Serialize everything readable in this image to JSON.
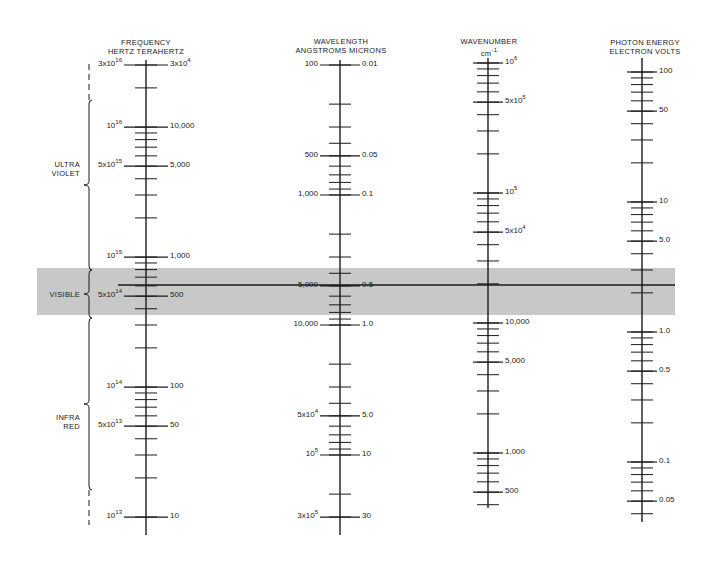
{
  "chart_data": {
    "type": "nomogram",
    "scale": "log10, 130 px per decade, all axes aligned",
    "visible_band": {
      "label": "VISIBLE",
      "highlight_color": "#c8c8c8",
      "reference_line_frequency_hz": 600000000000000.0
    },
    "regions": [
      {
        "label": "ULTRA VIOLET",
        "from_hz": 3e+16,
        "to_hz": 750000000000000.0
      },
      {
        "label": "VISIBLE",
        "from_hz": 750000000000000.0,
        "to_hz": 400000000000000.0
      },
      {
        "label": "INFRA RED",
        "from_hz": 400000000000000.0,
        "to_hz": 10000000000000.0
      }
    ],
    "axes": [
      {
        "name": "FREQUENCY",
        "units": [
          "HERTZ",
          "TERAHERTZ"
        ],
        "major": [
          {
            "hz": 3e+16,
            "left": "3x10^16",
            "right": "3x10^4"
          },
          {
            "hz": 1e+16,
            "left": "10^16",
            "right": "10,000"
          },
          {
            "hz": 5000000000000000.0,
            "left": "5x10^15",
            "right": "5,000"
          },
          {
            "hz": 1000000000000000.0,
            "left": "10^15",
            "right": "1,000"
          },
          {
            "hz": 500000000000000.0,
            "left": "5x10^14",
            "right": "500"
          },
          {
            "hz": 100000000000000.0,
            "left": "10^14",
            "right": "100"
          },
          {
            "hz": 50000000000000.0,
            "left": "5x10^13",
            "right": "50"
          },
          {
            "hz": 10000000000000.0,
            "left": "10^13",
            "right": "10"
          }
        ]
      },
      {
        "name": "WAVELENGTH",
        "units": [
          "ANGSTROMS",
          "MICRONS"
        ],
        "major": [
          {
            "angstrom": 100,
            "left": "100",
            "right": "0.01"
          },
          {
            "angstrom": 500,
            "left": "500",
            "right": "0.05"
          },
          {
            "angstrom": 1000,
            "left": "1,000",
            "right": "0.1"
          },
          {
            "angstrom": 5000,
            "left": "5,000",
            "right": "0.5"
          },
          {
            "angstrom": 10000,
            "left": "10,000",
            "right": "1.0"
          },
          {
            "angstrom": 50000,
            "left": "5x10^4",
            "right": "5.0"
          },
          {
            "angstrom": 100000,
            "left": "10^5",
            "right": "10"
          },
          {
            "angstrom": 300000,
            "left": "3x10^5",
            "right": "30"
          }
        ]
      },
      {
        "name": "WAVENUMBER",
        "units": [
          "cm^-1"
        ],
        "major": [
          {
            "value": 1000000.0,
            "label": "10^6"
          },
          {
            "value": 500000.0,
            "label": "5x10^5"
          },
          {
            "value": 100000.0,
            "label": "10^5"
          },
          {
            "value": 50000.0,
            "label": "5x10^4"
          },
          {
            "value": 10000.0,
            "label": "10,000"
          },
          {
            "value": 5000.0,
            "label": "5,000"
          },
          {
            "value": 1000.0,
            "label": "1,000"
          },
          {
            "value": 500,
            "label": "500"
          }
        ]
      },
      {
        "name": "PHOTON ENERGY",
        "units": [
          "ELECTRON VOLTS"
        ],
        "major": [
          {
            "value": 100,
            "label": "100"
          },
          {
            "value": 50,
            "label": "50"
          },
          {
            "value": 10,
            "label": "10"
          },
          {
            "value": 5,
            "label": "5.0"
          },
          {
            "value": 1,
            "label": "1.0"
          },
          {
            "value": 0.5,
            "label": "0.5"
          },
          {
            "value": 0.1,
            "label": "0.1"
          },
          {
            "value": 0.05,
            "label": "0.05"
          }
        ]
      }
    ]
  },
  "headers": {
    "frequency": {
      "line1": "FREQUENCY",
      "line2": "HERTZ  TERAHERTZ"
    },
    "wavelength": {
      "line1": "WAVELENGTH",
      "line2": "ANGSTROMS MICRONS"
    },
    "wavenumber": {
      "line1": "WAVENUMBER",
      "line2": "cm"
    },
    "wavenumber_exp": "-1",
    "energy": {
      "line1": "PHOTON ENERGY",
      "line2": "ELECTRON VOLTS"
    }
  },
  "regions": {
    "uv": {
      "line1": "ULTRA",
      "line2": "VIOLET"
    },
    "visible": "VISIBLE",
    "ir": {
      "line1": "INFRA",
      "line2": "RED"
    }
  },
  "colors": {
    "ink": "#1a1a1a",
    "band": "#c8c8c8"
  }
}
